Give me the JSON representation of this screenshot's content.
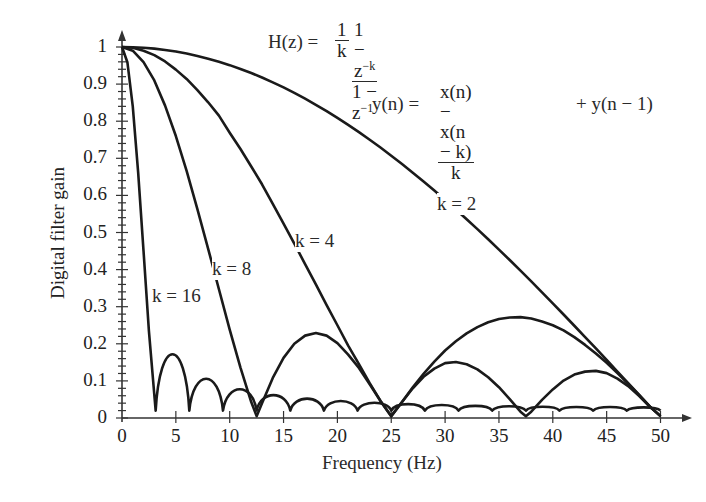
{
  "chart_data": {
    "type": "line",
    "title": "",
    "xlabel": "Frequency (Hz)",
    "ylabel": "Digital filter gain",
    "xlim": [
      0,
      50
    ],
    "ylim": [
      0,
      1
    ],
    "grid": false,
    "x_ticks": [
      "0",
      "5",
      "10",
      "15",
      "20",
      "25",
      "30",
      "35",
      "40",
      "45",
      "50"
    ],
    "y_ticks": [
      "0",
      "0.1",
      "0.2",
      "0.3",
      "0.4",
      "0.5",
      "0.6",
      "0.7",
      "0.8",
      "0.9",
      "1"
    ],
    "annotations": {
      "transfer_function": {
        "lhs": "H(z) = ",
        "coef_num": "1",
        "coef_den": "k",
        "num": "1 − z",
        "num_exp": "−k",
        "den": "1 − z",
        "den_exp": "−1"
      },
      "difference_equation": {
        "lhs": "y(n) = ",
        "num": "x(n) − x(n − k)",
        "den": "k",
        "rhs": "+ y(n − 1)"
      }
    },
    "series": [
      {
        "name": "k = 2",
        "label_pos": [
          470,
          205
        ],
        "x": [
          0,
          1,
          2,
          3,
          4,
          5,
          6,
          7,
          8,
          9,
          10,
          11,
          12,
          13,
          14,
          15,
          16,
          17,
          18,
          19,
          20,
          21,
          22,
          23,
          24,
          25,
          26,
          27,
          28,
          29,
          30,
          31,
          32,
          33,
          34,
          35,
          36,
          37,
          38,
          39,
          40,
          41,
          42,
          43,
          44,
          45,
          46,
          47,
          48,
          49,
          50
        ],
        "values": [
          1,
          0.9995,
          0.998,
          0.9956,
          0.9921,
          0.9877,
          0.9823,
          0.9759,
          0.9686,
          0.9603,
          0.9511,
          0.9409,
          0.9298,
          0.9178,
          0.9048,
          0.891,
          0.8763,
          0.8607,
          0.8443,
          0.8271,
          0.809,
          0.7902,
          0.7705,
          0.7501,
          0.729,
          0.7071,
          0.6845,
          0.6613,
          0.6374,
          0.6129,
          0.5878,
          0.5621,
          0.5358,
          0.509,
          0.4818,
          0.454,
          0.4258,
          0.3971,
          0.3681,
          0.3387,
          0.309,
          0.279,
          0.2487,
          0.2181,
          0.1874,
          0.1564,
          0.1253,
          0.0941,
          0.0628,
          0.0314,
          0
        ]
      },
      {
        "name": "k = 4",
        "label_pos": [
          328,
          242
        ],
        "x": [
          0,
          1,
          2,
          3,
          4,
          5,
          6,
          7,
          8,
          9,
          10,
          11,
          12,
          13,
          14,
          15,
          16,
          17,
          18,
          19,
          20,
          21,
          22,
          23,
          24,
          25,
          26,
          27,
          28,
          29,
          30,
          31,
          32,
          33,
          34,
          35,
          36,
          37,
          38,
          39,
          40,
          41,
          42,
          43,
          44,
          45,
          46,
          47,
          48,
          49,
          50
        ],
        "values": [
          1,
          0.998,
          0.99,
          0.978,
          0.961,
          0.939,
          0.914,
          0.884,
          0.851,
          0.815,
          0.769,
          0.725,
          0.678,
          0.63,
          0.577,
          0.524,
          0.47,
          0.415,
          0.36,
          0.304,
          0.25,
          0.195,
          0.145,
          0.094,
          0.046,
          0,
          0.043,
          0.083,
          0.119,
          0.152,
          0.182,
          0.207,
          0.228,
          0.245,
          0.258,
          0.267,
          0.271,
          0.272,
          0.268,
          0.26,
          0.25,
          0.236,
          0.218,
          0.197,
          0.174,
          0.149,
          0.121,
          0.092,
          0.062,
          0.031,
          0
        ]
      },
      {
        "name": "k = 8",
        "label_pos": [
          245,
          270
        ],
        "x": [
          0,
          1,
          2,
          3,
          4,
          5,
          6,
          7,
          8,
          9,
          10,
          11,
          12,
          12.5,
          13,
          14,
          15,
          16,
          17,
          18,
          19,
          20,
          21,
          22,
          23,
          24,
          25,
          26,
          27,
          28,
          29,
          30,
          31,
          32,
          33,
          34,
          35,
          36,
          37,
          37.5,
          38,
          39,
          40,
          41,
          42,
          43,
          44,
          45,
          46,
          47,
          48,
          49,
          50
        ],
        "values": [
          1,
          0.99,
          0.959,
          0.91,
          0.842,
          0.76,
          0.666,
          0.563,
          0.456,
          0.347,
          0.238,
          0.136,
          0.043,
          0,
          0.04,
          0.108,
          0.162,
          0.2,
          0.222,
          0.229,
          0.222,
          0.202,
          0.171,
          0.135,
          0.091,
          0.046,
          0,
          0.043,
          0.08,
          0.111,
          0.133,
          0.148,
          0.151,
          0.145,
          0.131,
          0.11,
          0.083,
          0.051,
          0.017,
          0,
          0.017,
          0.049,
          0.077,
          0.101,
          0.117,
          0.125,
          0.127,
          0.121,
          0.106,
          0.086,
          0.06,
          0.031,
          0
        ]
      },
      {
        "name": "k = 16",
        "label_pos": [
          185,
          297
        ],
        "x": [
          0,
          0.5,
          1,
          1.5,
          2,
          2.5,
          3.125,
          4.69,
          6.25,
          7.81,
          9.375,
          10.94,
          12.5,
          14.06,
          15.625,
          17.19,
          18.75,
          20.31,
          21.875,
          23.44,
          25,
          26.56,
          28.125,
          29.69,
          31.25,
          32.81,
          34.375,
          35.94,
          37.5,
          39.06,
          40.625,
          42.19,
          43.75,
          45.31,
          46.875,
          48.44,
          50
        ],
        "values": [
          1,
          0.959,
          0.84,
          0.662,
          0.45,
          0.234,
          0,
          0.213,
          0,
          0.129,
          0,
          0.093,
          0,
          0.073,
          0,
          0.061,
          0,
          0.053,
          0,
          0.047,
          0,
          0.042,
          0,
          0.039,
          0,
          0.036,
          0,
          0.035,
          0,
          0.033,
          0,
          0.032,
          0,
          0.032,
          0,
          0.031,
          0
        ]
      }
    ]
  }
}
